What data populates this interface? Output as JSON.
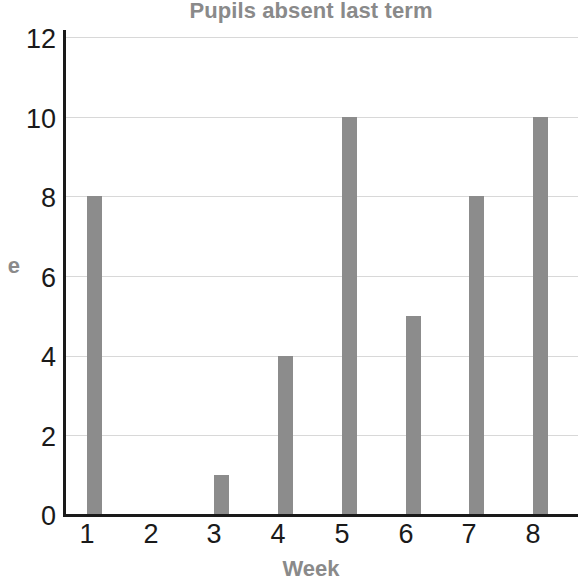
{
  "chart_data": {
    "type": "bar",
    "title": "Pupils absent last term",
    "xlabel": "Week",
    "ylabel": "e",
    "ylabel_note": "y-axis title is clipped at the left edge of the screenshot; only the final letter is visible",
    "categories": [
      "1",
      "2",
      "3",
      "4",
      "5",
      "6",
      "7",
      "8"
    ],
    "values": [
      8,
      0,
      1,
      4,
      10,
      5,
      8,
      10
    ],
    "yticks": [
      "0",
      "2",
      "4",
      "6",
      "8",
      "10",
      "12"
    ],
    "ylim": [
      0,
      12
    ],
    "grid": "horizontal",
    "legend": "none",
    "bar_color": "#8c8c8c",
    "gridline_color": "#d8d8d8",
    "axis_color": "#1a1a1a",
    "title_color": "#8a8a8a",
    "tick_label_color": "#1a1a1a",
    "background": "#ffffff"
  }
}
